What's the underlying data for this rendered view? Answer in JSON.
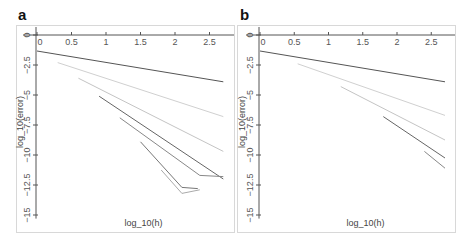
{
  "panels": [
    {
      "label": "a"
    },
    {
      "label": "b"
    }
  ],
  "chart_data": [
    {
      "type": "line",
      "panel": "a",
      "xlabel": "log_10(h)",
      "ylabel": "log_10(error)",
      "xticks": [
        "0",
        "0.5",
        "1",
        "1.5",
        "2",
        "2.5"
      ],
      "yticks": [
        "0",
        "-2.5",
        "-5",
        "-7.5",
        "-10",
        "-12.5",
        "-15"
      ],
      "xlim": [
        0,
        2.75
      ],
      "ylim": [
        -16,
        0
      ],
      "grid": false,
      "series": [
        {
          "name": "series1",
          "color": "#555555",
          "x": [
            0,
            2.7
          ],
          "y": [
            -1.33,
            -3.9
          ]
        },
        {
          "name": "series2",
          "color": "#d0d0d0",
          "x": [
            0.3,
            2.7
          ],
          "y": [
            -2.3,
            -6.8
          ]
        },
        {
          "name": "series3",
          "color": "#c4c4c4",
          "x": [
            0.6,
            2.7
          ],
          "y": [
            -3.6,
            -9.7
          ]
        },
        {
          "name": "series4",
          "color": "#666666",
          "x": [
            0.9,
            2.7
          ],
          "y": [
            -5.1,
            -12.0
          ]
        },
        {
          "name": "series5",
          "color": "#888888",
          "x": [
            1.2,
            2.36,
            2.7
          ],
          "y": [
            -6.9,
            -11.7,
            -11.8
          ]
        },
        {
          "name": "series6",
          "color": "#777777",
          "x": [
            1.5,
            2.1,
            2.33
          ],
          "y": [
            -8.9,
            -12.7,
            -12.8
          ]
        },
        {
          "name": "series7",
          "color": "#aaaaaa",
          "x": [
            1.8,
            2.1,
            2.36
          ],
          "y": [
            -11.25,
            -13.2,
            -12.9
          ]
        }
      ]
    },
    {
      "type": "line",
      "panel": "b",
      "xlabel": "log_10(h)",
      "ylabel": "log_10(error)",
      "xticks": [
        "0",
        "0.5",
        "1",
        "1.5",
        "2",
        "2.5"
      ],
      "yticks": [
        "0",
        "-2.5",
        "-5",
        "-7.5",
        "-10",
        "-12.5",
        "-15"
      ],
      "xlim": [
        0,
        2.75
      ],
      "ylim": [
        -16,
        0
      ],
      "grid": false,
      "series": [
        {
          "name": "series1",
          "color": "#555555",
          "x": [
            0,
            2.7
          ],
          "y": [
            -1.33,
            -3.9
          ]
        },
        {
          "name": "series2",
          "color": "#d0d0d0",
          "x": [
            0.55,
            2.7
          ],
          "y": [
            -2.4,
            -6.7
          ]
        },
        {
          "name": "series3",
          "color": "#c4c4c4",
          "x": [
            1.18,
            2.7
          ],
          "y": [
            -4.3,
            -8.75
          ]
        },
        {
          "name": "series4",
          "color": "#666666",
          "x": [
            1.8,
            2.7
          ],
          "y": [
            -6.8,
            -10.25
          ]
        },
        {
          "name": "series5",
          "color": "#888888",
          "x": [
            2.4,
            2.7
          ],
          "y": [
            -9.7,
            -11.1
          ]
        }
      ]
    }
  ]
}
